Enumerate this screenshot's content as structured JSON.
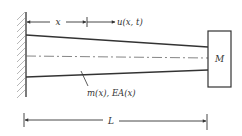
{
  "diagram": {
    "labels": {
      "x": "x",
      "displacement": "u(x, t)",
      "mass": "M",
      "properties": "m(x), EA(x)",
      "length": "L"
    },
    "colors": {
      "line": "#333333",
      "hatch": "#9a9a9a",
      "background": "#ffffff"
    }
  }
}
